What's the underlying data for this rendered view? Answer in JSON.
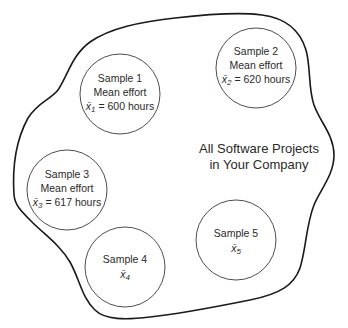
{
  "population": {
    "line1": "All Software Projects",
    "line2": "in Your Company"
  },
  "samples": [
    {
      "title": "Sample 1",
      "subtitle": "Mean effort",
      "symbol": "x̄",
      "index": "1",
      "value_text": " = 600 hours",
      "mean_hours": 600
    },
    {
      "title": "Sample 2",
      "subtitle": "Mean effort",
      "symbol": "x̄",
      "index": "2",
      "value_text": " = 620 hours",
      "mean_hours": 620
    },
    {
      "title": "Sample 3",
      "subtitle": "Mean effort",
      "symbol": "x̄",
      "index": "3",
      "value_text": " = 617 hours",
      "mean_hours": 617
    },
    {
      "title": "Sample 4",
      "symbol": "x̄",
      "index": "4"
    },
    {
      "title": "Sample 5",
      "symbol": "x̄",
      "index": "5"
    }
  ],
  "colors": {
    "outline": "#1a1a1a",
    "circle_stroke": "#3a3a3a",
    "text": "#2a2a2a",
    "background": "#ffffff"
  }
}
